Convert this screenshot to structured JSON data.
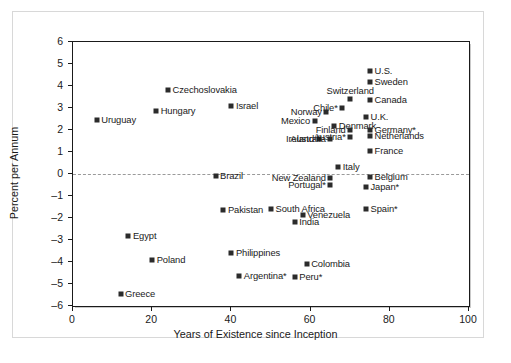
{
  "chart_data": {
    "type": "scatter",
    "title": "",
    "xlabel": "Years of Existence since Inception",
    "ylabel": "Percent per Annum",
    "xlim": [
      0,
      100
    ],
    "ylim": [
      -6,
      6
    ],
    "xticks": [
      0,
      20,
      40,
      60,
      80,
      100
    ],
    "yticks": [
      6,
      5,
      4,
      3,
      2,
      1,
      0,
      -1,
      -2,
      -3,
      -4,
      -5,
      -6
    ],
    "grid": false,
    "legend": "none",
    "annotations": [
      "dashed horizontal reference line at y = 0"
    ],
    "marker_color": "#2b2b2b",
    "points": [
      {
        "label": "U.S.",
        "x": 75,
        "y": 4.7,
        "anchor": "right"
      },
      {
        "label": "Sweden",
        "x": 75,
        "y": 4.2,
        "anchor": "right"
      },
      {
        "label": "Switzerland",
        "x": 70,
        "y": 3.4,
        "anchor": "above"
      },
      {
        "label": "Canada",
        "x": 75,
        "y": 3.35,
        "anchor": "right"
      },
      {
        "label": "Chile*",
        "x": 68,
        "y": 3.0,
        "anchor": "left"
      },
      {
        "label": "Czechoslovakia",
        "x": 24,
        "y": 3.8,
        "anchor": "right"
      },
      {
        "label": "Israel",
        "x": 40,
        "y": 3.1,
        "anchor": "right"
      },
      {
        "label": "Hungary",
        "x": 21,
        "y": 2.85,
        "anchor": "right"
      },
      {
        "label": "Uruguay",
        "x": 6,
        "y": 2.45,
        "anchor": "right"
      },
      {
        "label": "U.K.",
        "x": 74,
        "y": 2.6,
        "anchor": "right"
      },
      {
        "label": "Norway",
        "x": 64,
        "y": 2.8,
        "anchor": "left"
      },
      {
        "label": "Mexico",
        "x": 61,
        "y": 2.4,
        "anchor": "left"
      },
      {
        "label": "Denmark",
        "x": 66,
        "y": 2.2,
        "anchor": "right"
      },
      {
        "label": "Finland",
        "x": 70,
        "y": 2.0,
        "anchor": "left"
      },
      {
        "label": "Germany*",
        "x": 75,
        "y": 2.0,
        "anchor": "right"
      },
      {
        "label": "Ireland",
        "x": 62,
        "y": 1.6,
        "anchor": "left"
      },
      {
        "label": "Austria*",
        "x": 70,
        "y": 1.7,
        "anchor": "left"
      },
      {
        "label": "Netherlands",
        "x": 75,
        "y": 1.75,
        "anchor": "right"
      },
      {
        "label": "Australia",
        "x": 65,
        "y": 1.6,
        "anchor": "left"
      },
      {
        "label": "France",
        "x": 75,
        "y": 1.05,
        "anchor": "right"
      },
      {
        "label": "Italy",
        "x": 67,
        "y": 0.3,
        "anchor": "right"
      },
      {
        "label": "Brazil",
        "x": 36,
        "y": -0.1,
        "anchor": "right"
      },
      {
        "label": "New Zealand",
        "x": 65,
        "y": -0.2,
        "anchor": "left"
      },
      {
        "label": "Belgium",
        "x": 75,
        "y": -0.15,
        "anchor": "right"
      },
      {
        "label": "Portugal*",
        "x": 65,
        "y": -0.5,
        "anchor": "left"
      },
      {
        "label": "Japan*",
        "x": 74,
        "y": -0.6,
        "anchor": "right"
      },
      {
        "label": "Pakistan",
        "x": 38,
        "y": -1.65,
        "anchor": "right"
      },
      {
        "label": "South Africa",
        "x": 50,
        "y": -1.6,
        "anchor": "right"
      },
      {
        "label": "Spain*",
        "x": 74,
        "y": -1.6,
        "anchor": "right"
      },
      {
        "label": "Venezuela",
        "x": 58,
        "y": -1.85,
        "anchor": "right"
      },
      {
        "label": "India",
        "x": 56,
        "y": -2.2,
        "anchor": "right"
      },
      {
        "label": "Egypt",
        "x": 14,
        "y": -2.8,
        "anchor": "right"
      },
      {
        "label": "Poland",
        "x": 20,
        "y": -3.9,
        "anchor": "right"
      },
      {
        "label": "Philippines",
        "x": 40,
        "y": -3.6,
        "anchor": "right"
      },
      {
        "label": "Colombia",
        "x": 59,
        "y": -4.1,
        "anchor": "right"
      },
      {
        "label": "Argentina*",
        "x": 42,
        "y": -4.65,
        "anchor": "right"
      },
      {
        "label": "Peru*",
        "x": 56,
        "y": -4.7,
        "anchor": "right"
      },
      {
        "label": "Greece",
        "x": 12,
        "y": -5.45,
        "anchor": "right"
      }
    ]
  }
}
